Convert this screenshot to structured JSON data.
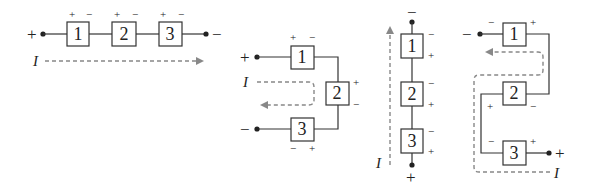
{
  "figure": {
    "colors": {
      "wire": "#333333",
      "current_arrow": "#888888",
      "background": "#ffffff"
    }
  },
  "diagrams": [
    {
      "id": "a",
      "layout": "horizontal",
      "elements": [
        "1",
        "2",
        "3"
      ],
      "element_polarities": [
        [
          "+",
          "−"
        ],
        [
          "+",
          "−"
        ],
        [
          "+",
          "−"
        ]
      ],
      "terminals": {
        "left": "+",
        "right": "−"
      },
      "current_label": "I"
    },
    {
      "id": "b",
      "layout": "folded-left",
      "elements": [
        "1",
        "2",
        "3"
      ],
      "element_polarities": [
        [
          "+",
          "−"
        ],
        [
          "+",
          "−"
        ],
        [
          "−",
          "+"
        ]
      ],
      "terminals": {
        "top": "+",
        "bottom": "−"
      },
      "current_label": "I"
    },
    {
      "id": "c",
      "layout": "vertical",
      "elements": [
        "1",
        "2",
        "3"
      ],
      "element_polarities": [
        [
          "−",
          "+"
        ],
        [
          "−",
          "+"
        ],
        [
          "−",
          "+"
        ]
      ],
      "terminals": {
        "top": "−",
        "bottom": "+"
      },
      "current_label": "I"
    },
    {
      "id": "d",
      "layout": "serpentine",
      "elements": [
        "1",
        "2",
        "3"
      ],
      "element_polarities": [
        [
          "−",
          "+"
        ],
        [
          "+",
          "−"
        ],
        [
          "−",
          "+"
        ]
      ],
      "terminals": {
        "top": "−",
        "bottom": "+"
      },
      "current_label": "I"
    }
  ]
}
